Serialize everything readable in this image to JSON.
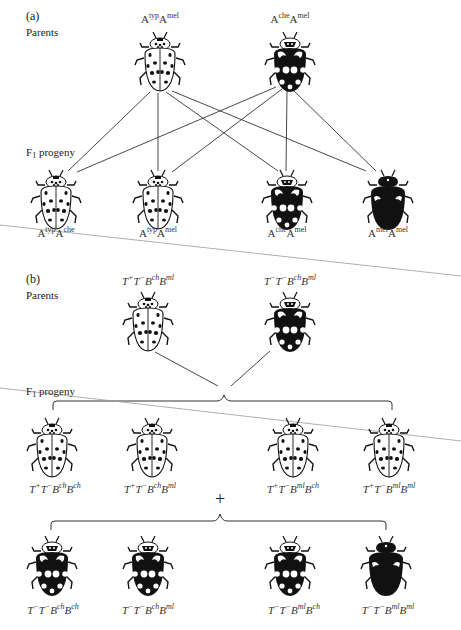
{
  "panel_a": {
    "letter": "(a)",
    "parents_label": "Parents",
    "f1_label_main": "F",
    "f1_label_sub": "1",
    "f1_label_rest": " progeny",
    "parents": [
      {
        "allele1": "A",
        "sup1": "typ",
        "allele2": "A",
        "sup2": "mel",
        "phenotype": "succinea-typical"
      },
      {
        "allele1": "A",
        "sup1": "che",
        "allele2": "A",
        "sup2": "mel",
        "phenotype": "conspicua-spotted"
      }
    ],
    "progeny": [
      {
        "allele1": "A",
        "sup1": "typ",
        "allele2": "A",
        "sup2": "che",
        "phenotype": "succinea-typical"
      },
      {
        "allele1": "A",
        "sup1": "typ",
        "allele2": "A",
        "sup2": "mel",
        "phenotype": "succinea-typical"
      },
      {
        "allele1": "A",
        "sup1": "che",
        "allele2": "A",
        "sup2": "mel",
        "phenotype": "conspicua-spotted"
      },
      {
        "allele1": "A",
        "sup1": "mel",
        "allele2": "A",
        "sup2": "mel",
        "phenotype": "melanic"
      }
    ]
  },
  "panel_b": {
    "letter": "(b)",
    "parents_label": "Parents",
    "f1_label_main": "F",
    "f1_label_sub": "1",
    "f1_label_rest": " progeny",
    "plus_sign": "+",
    "parents": [
      {
        "t1": "T",
        "ts1": "+",
        "t2": "T",
        "ts2": "−",
        "b1": "B",
        "bs1": "ch",
        "b2": "B",
        "bs2": "ml",
        "phenotype": "succinea-typical"
      },
      {
        "t1": "T",
        "ts1": "−",
        "t2": "T",
        "ts2": "−",
        "b1": "B",
        "bs1": "ch",
        "b2": "B",
        "bs2": "ml",
        "phenotype": "conspicua-spotted"
      }
    ],
    "progeny_row1": [
      {
        "t1": "T",
        "ts1": "+",
        "t2": "T",
        "ts2": "−",
        "b1": "B",
        "bs1": "ch",
        "b2": "B",
        "bs2": "ch",
        "phenotype": "succinea-typical"
      },
      {
        "t1": "T",
        "ts1": "+",
        "t2": "T",
        "ts2": "−",
        "b1": "B",
        "bs1": "ch",
        "b2": "B",
        "bs2": "ml",
        "phenotype": "succinea-typical"
      },
      {
        "t1": "T",
        "ts1": "+",
        "t2": "T",
        "ts2": "−",
        "b1": "B",
        "bs1": "ml",
        "b2": "B",
        "bs2": "ch",
        "phenotype": "succinea-typical"
      },
      {
        "t1": "T",
        "ts1": "+",
        "t2": "T",
        "ts2": "−",
        "b1": "B",
        "bs1": "ml",
        "b2": "B",
        "bs2": "ml",
        "phenotype": "succinea-typical"
      }
    ],
    "progeny_row2": [
      {
        "t1": "T",
        "ts1": "−",
        "t2": "T",
        "ts2": "−",
        "b1": "B",
        "bs1": "ch",
        "b2": "B",
        "bs2": "ch",
        "phenotype": "conspicua-spotted"
      },
      {
        "t1": "T",
        "ts1": "−",
        "t2": "T",
        "ts2": "−",
        "b1": "B",
        "bs1": "ch",
        "b2": "B",
        "bs2": "ml",
        "phenotype": "conspicua-spotted"
      },
      {
        "t1": "T",
        "ts1": "−",
        "t2": "T",
        "ts2": "−",
        "b1": "B",
        "bs1": "ml",
        "b2": "B",
        "bs2": "ch",
        "phenotype": "conspicua-spotted"
      },
      {
        "t1": "T",
        "ts1": "−",
        "t2": "T",
        "ts2": "−",
        "b1": "B",
        "bs1": "ml",
        "b2": "B",
        "bs2": "ml",
        "phenotype": "melanic"
      }
    ]
  },
  "colors": {
    "ink": "#111111",
    "cross_line": "#333333",
    "scan_line": "#9a9a9a",
    "background": "#ffffff"
  }
}
